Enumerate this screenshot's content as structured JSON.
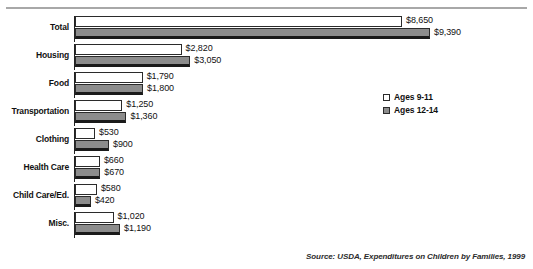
{
  "title_partial": "",
  "legend": {
    "position": "right-middle",
    "entries": [
      {
        "label": "Ages 9-11",
        "swatch": "white-outline",
        "color": "#ffffff"
      },
      {
        "label": "Ages 12-14",
        "swatch": "gray-filled",
        "color": "#8c8c8c"
      }
    ]
  },
  "source": "Source: USDA, Expenditures on Children by Families, 1999",
  "chart_data": {
    "type": "bar",
    "orientation": "horizontal",
    "title": "",
    "xlabel": "",
    "ylabel": "",
    "grid": false,
    "axis_visible": false,
    "xlim": [
      0,
      9390
    ],
    "categories": [
      "Total",
      "Housing",
      "Food",
      "Transportation",
      "Clothing",
      "Health Care",
      "Child Care/Ed.",
      "Misc."
    ],
    "series": [
      {
        "name": "Ages 9-11",
        "color": "#ffffff",
        "values": [
          8650,
          2820,
          1790,
          1250,
          530,
          660,
          580,
          1020
        ],
        "labels": [
          "$8,650",
          "$2,820",
          "$1,790",
          "$1,250",
          "$530",
          "$660",
          "$580",
          "$1,020"
        ]
      },
      {
        "name": "Ages 12-14",
        "color": "#8c8c8c",
        "values": [
          9390,
          3050,
          1800,
          1360,
          900,
          670,
          420,
          1190
        ],
        "labels": [
          "$9,390",
          "$3,050",
          "$1,800",
          "$1,360",
          "$900",
          "$670",
          "$420",
          "$1,190"
        ]
      }
    ]
  }
}
